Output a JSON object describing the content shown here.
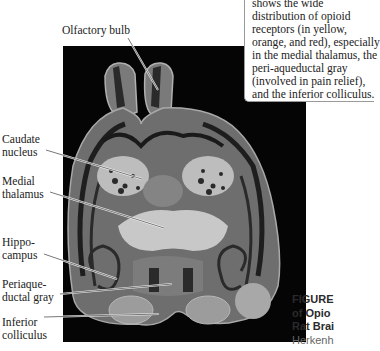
{
  "caption_box": {
    "lines": [
      "shows the wide",
      "distribution of opioid",
      "receptors (in yellow,",
      "orange, and red), especially",
      "in the medial thalamus, the",
      "peri-aqueductal gray",
      "(involved in pain relief),",
      "and the inferior colliculus."
    ]
  },
  "labels": {
    "olfactory_bulb": "Olfactory bulb",
    "caudate_1": "Caudate",
    "caudate_2": "nucleus",
    "medial_1": "Medial",
    "medial_2": "thalamus",
    "hippo_1": "Hippo-",
    "hippo_2": "campus",
    "peri_1": "Periaque-",
    "peri_2": "ductal gray",
    "inferior_1": "Inferior",
    "inferior_2": "colliculus"
  },
  "figure_caption": {
    "line1": "FIGURE",
    "line2": "of Opio",
    "line3": "Rat Brai",
    "line4": "Herkenh"
  }
}
